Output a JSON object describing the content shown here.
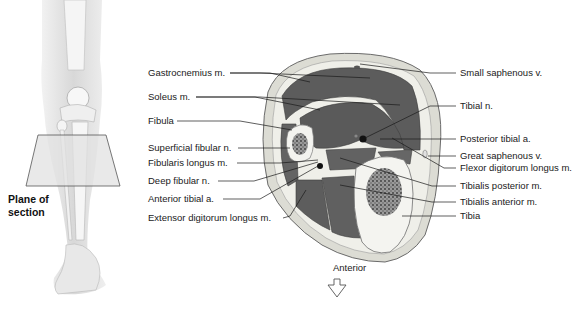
{
  "figure": {
    "left_panel": {
      "plane_label_line1": "Plane of",
      "plane_label_line2": "section"
    },
    "orientation": {
      "label": "Anterior",
      "icon": "arrow-down-outline-icon"
    },
    "labels_left": [
      {
        "text": "Gastrocnemius m."
      },
      {
        "text": "Soleus m."
      },
      {
        "text": "Fibula"
      },
      {
        "text": "Superficial fibular n."
      },
      {
        "text": "Fibularis longus m."
      },
      {
        "text": "Deep fibular n."
      },
      {
        "text": "Anterior tibial a."
      },
      {
        "text": "Extensor digitorum longus m."
      }
    ],
    "labels_right": [
      {
        "text": "Small saphenous v."
      },
      {
        "text": "Tibial n."
      },
      {
        "text": "Posterior tibial a."
      },
      {
        "text": "Great saphenous v."
      },
      {
        "text": "Flexor digitorum longus m."
      },
      {
        "text": "Tibialis posterior m."
      },
      {
        "text": "Tibialis anterior m."
      },
      {
        "text": "Tibia"
      }
    ]
  }
}
